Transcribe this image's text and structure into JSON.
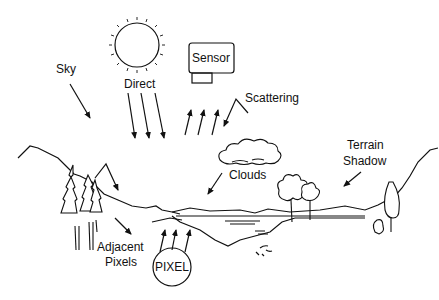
{
  "diagram": {
    "labels": {
      "sky": "Sky",
      "direct": "Direct",
      "sensor": "Sensor",
      "scattering": "Scattering",
      "terrain_shadow_line1": "Terrain",
      "terrain_shadow_line2": "Shadow",
      "clouds": "Clouds",
      "adjacent_line1": "Adjacent",
      "adjacent_line2": "Pixels",
      "pixel": "PIXEL"
    },
    "colors": {
      "stroke": "#111111",
      "background": "#ffffff"
    }
  }
}
